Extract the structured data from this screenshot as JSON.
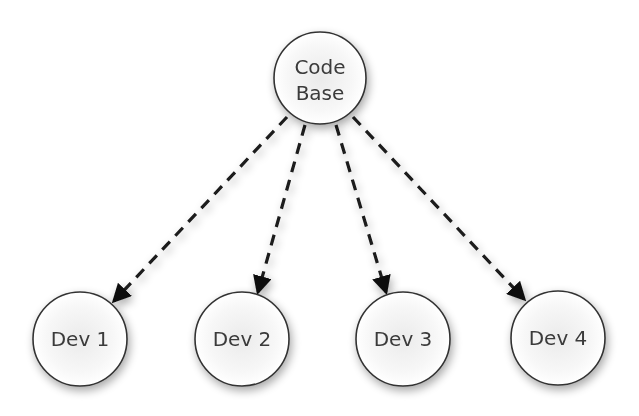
{
  "diagram": {
    "type": "tree",
    "colors": {
      "node_stroke": "#333333",
      "node_fill": "#ffffff",
      "edge": "#1a1a1a",
      "shadow": "#bdbdbd"
    },
    "nodes": [
      {
        "id": "code-base",
        "label_lines": [
          "Code",
          "Base"
        ],
        "cx": 320,
        "cy": 78,
        "r": 46
      },
      {
        "id": "dev-1",
        "label": "Dev 1",
        "cx": 80,
        "cy": 339,
        "r": 47
      },
      {
        "id": "dev-2",
        "label": "Dev 2",
        "cx": 242,
        "cy": 339,
        "r": 47
      },
      {
        "id": "dev-3",
        "label": "Dev 3",
        "cx": 403,
        "cy": 339,
        "r": 47
      },
      {
        "id": "dev-4",
        "label": "Dev 4",
        "cx": 558,
        "cy": 338,
        "r": 47
      }
    ],
    "edges": [
      {
        "from": "code-base",
        "to": "dev-1",
        "style": "dashed-arrow"
      },
      {
        "from": "code-base",
        "to": "dev-2",
        "style": "dashed-arrow"
      },
      {
        "from": "code-base",
        "to": "dev-3",
        "style": "dashed-arrow"
      },
      {
        "from": "code-base",
        "to": "dev-4",
        "style": "dashed-arrow"
      }
    ]
  }
}
